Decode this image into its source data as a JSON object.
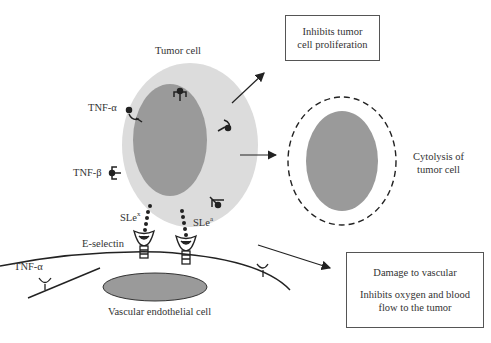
{
  "labels": {
    "tumor_cell": "Tumor cell",
    "tnf_alpha_top": "TNF-α",
    "tnf_beta": "TNF-β",
    "slex": "SLe",
    "slex_sup": "x",
    "slea": "SLe",
    "slea_sup": "a",
    "e_selectin": "E-selectin",
    "tnf_alpha_bottom": "TNF-α",
    "vascular_cell": "Vascular endothelial cell",
    "cytolysis_line1": "Cytolysis of",
    "cytolysis_line2": "tumor cell"
  },
  "boxes": {
    "proliferation_line1": "Inhibits tumor",
    "proliferation_line2": "cell proliferation",
    "vascular_line1": "Damage to vascular",
    "vascular_line2": "Inhibits oxygen and blood",
    "vascular_line3": "flow to the tumor"
  },
  "colors": {
    "cytoplasm": "#dcdcdc",
    "nucleus": "#9a9a9a",
    "line": "#222222"
  }
}
